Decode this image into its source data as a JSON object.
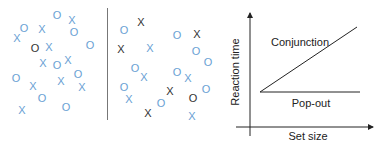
{
  "colors": {
    "blue": "#6a9fd4",
    "black": "#333333",
    "axis": "#222222",
    "divider": "#777777"
  },
  "panels": {
    "feature_search": {
      "items": [
        {
          "g": "O",
          "x": 57,
          "y": 15,
          "c": "blue"
        },
        {
          "g": "X",
          "x": 72,
          "y": 20,
          "c": "blue"
        },
        {
          "g": "O",
          "x": 24,
          "y": 28,
          "c": "blue"
        },
        {
          "g": "X",
          "x": 42,
          "y": 29,
          "c": "blue"
        },
        {
          "g": "X",
          "x": 17,
          "y": 38,
          "c": "blue"
        },
        {
          "g": "O",
          "x": 74,
          "y": 32,
          "c": "blue"
        },
        {
          "g": "O",
          "x": 35,
          "y": 48,
          "c": "black"
        },
        {
          "g": "X",
          "x": 49,
          "y": 47,
          "c": "blue"
        },
        {
          "g": "O",
          "x": 90,
          "y": 45,
          "c": "blue"
        },
        {
          "g": "X",
          "x": 43,
          "y": 63,
          "c": "blue"
        },
        {
          "g": "O",
          "x": 57,
          "y": 65,
          "c": "blue"
        },
        {
          "g": "X",
          "x": 68,
          "y": 60,
          "c": "blue"
        },
        {
          "g": "O",
          "x": 78,
          "y": 74,
          "c": "blue"
        },
        {
          "g": "O",
          "x": 16,
          "y": 78,
          "c": "blue"
        },
        {
          "g": "X",
          "x": 61,
          "y": 81,
          "c": "blue"
        },
        {
          "g": "X",
          "x": 33,
          "y": 86,
          "c": "blue"
        },
        {
          "g": "X",
          "x": 82,
          "y": 87,
          "c": "blue"
        },
        {
          "g": "O",
          "x": 42,
          "y": 98,
          "c": "blue"
        },
        {
          "g": "X",
          "x": 22,
          "y": 110,
          "c": "blue"
        },
        {
          "g": "O",
          "x": 66,
          "y": 107,
          "c": "blue"
        }
      ]
    },
    "conjunction_search": {
      "items": [
        {
          "g": "O",
          "x": 124,
          "y": 30,
          "c": "blue"
        },
        {
          "g": "X",
          "x": 141,
          "y": 22,
          "c": "black"
        },
        {
          "g": "X",
          "x": 121,
          "y": 49,
          "c": "black"
        },
        {
          "g": "X",
          "x": 150,
          "y": 48,
          "c": "blue"
        },
        {
          "g": "O",
          "x": 177,
          "y": 35,
          "c": "blue"
        },
        {
          "g": "X",
          "x": 197,
          "y": 34,
          "c": "black"
        },
        {
          "g": "O",
          "x": 196,
          "y": 51,
          "c": "blue"
        },
        {
          "g": "O",
          "x": 208,
          "y": 62,
          "c": "blue"
        },
        {
          "g": "O",
          "x": 135,
          "y": 68,
          "c": "blue"
        },
        {
          "g": "X",
          "x": 144,
          "y": 77,
          "c": "blue"
        },
        {
          "g": "O",
          "x": 177,
          "y": 72,
          "c": "blue"
        },
        {
          "g": "X",
          "x": 188,
          "y": 78,
          "c": "blue"
        },
        {
          "g": "O",
          "x": 124,
          "y": 87,
          "c": "blue"
        },
        {
          "g": "X",
          "x": 170,
          "y": 91,
          "c": "black"
        },
        {
          "g": "O",
          "x": 206,
          "y": 89,
          "c": "blue"
        },
        {
          "g": "X",
          "x": 129,
          "y": 99,
          "c": "blue"
        },
        {
          "g": "O",
          "x": 161,
          "y": 103,
          "c": "blue"
        },
        {
          "g": "O",
          "x": 193,
          "y": 98,
          "c": "black"
        },
        {
          "g": "X",
          "x": 148,
          "y": 113,
          "c": "black"
        },
        {
          "g": "X",
          "x": 192,
          "y": 116,
          "c": "blue"
        }
      ]
    }
  },
  "graph": {
    "ylabel": "Reaction time",
    "xlabel": "Set size",
    "conjunction_label": "Conjunction",
    "popout_label": "Pop-out"
  },
  "chart_data": {
    "type": "line",
    "title": "",
    "xlabel": "Set size",
    "ylabel": "Reaction time",
    "series": [
      {
        "name": "Conjunction",
        "x": [
          0,
          1
        ],
        "values": [
          0,
          1
        ]
      },
      {
        "name": "Pop-out",
        "x": [
          0,
          1
        ],
        "values": [
          0,
          0
        ]
      }
    ],
    "grid": false,
    "ticks": "none"
  }
}
